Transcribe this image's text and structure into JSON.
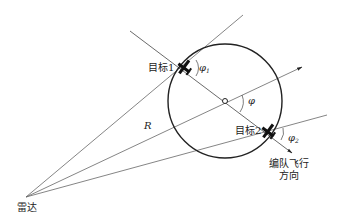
{
  "diagram": {
    "type": "radar-formation-geometry",
    "labels": {
      "radar": "雷达",
      "target1": "目标1",
      "target2": "目标2",
      "range": "R",
      "angle": "φ",
      "angle1": "φ",
      "angle1_sub": "1",
      "angle2": "φ",
      "angle2_sub": "2",
      "direction_line1": "编队飞行",
      "direction_line2": "方向"
    },
    "colors": {
      "line": "#555555",
      "circle": "#222222",
      "aircraft": "#111111",
      "background": "#ffffff"
    },
    "geometry": {
      "radar": [
        26,
        197
      ],
      "circle_center": [
        225,
        101
      ],
      "circle_radius": 57,
      "target1": [
        184,
        68
      ],
      "target2": [
        268,
        132
      ]
    }
  }
}
